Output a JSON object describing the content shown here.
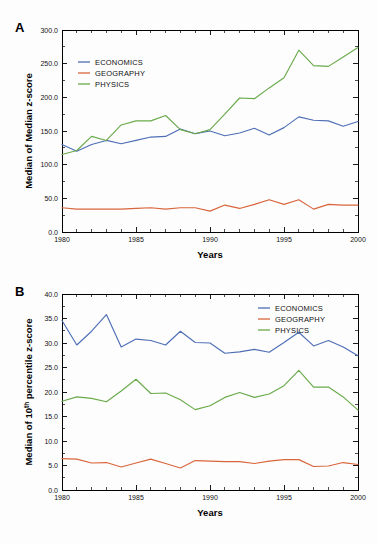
{
  "figure": {
    "background": "#fdfdfd",
    "panels": [
      "A",
      "B"
    ]
  },
  "colors": {
    "economics": "#4f6fb5",
    "geography": "#d9653b",
    "physics": "#6aaa4a",
    "axis": "#000000"
  },
  "panel_a": {
    "label": "A",
    "chart_data": {
      "type": "line",
      "title": "",
      "xlabel": "Years",
      "ylabel": "Median of Median z-score",
      "xlim": [
        1980,
        2000
      ],
      "ylim": [
        0,
        300
      ],
      "xticks": [
        1980,
        1985,
        1990,
        1995,
        2000
      ],
      "xtick_labels": [
        "1980",
        "1985",
        "1990",
        "1995",
        "2000"
      ],
      "yticks": [
        0,
        50,
        100,
        150,
        200,
        250,
        300
      ],
      "ytick_labels": [
        "0.0",
        "50.0",
        "100.0",
        "150.0",
        "200.0",
        "250.0",
        "300.0"
      ],
      "x": [
        1980,
        1981,
        1982,
        1983,
        1984,
        1985,
        1986,
        1987,
        1988,
        1989,
        1990,
        1991,
        1992,
        1993,
        1994,
        1995,
        1996,
        1997,
        1998,
        1999,
        2000
      ],
      "grid": false,
      "legend_position": "upper-left",
      "series": [
        {
          "name": "ECONOMICS",
          "color": "#4f6fb5",
          "values": [
            130,
            120,
            130,
            136,
            131,
            136,
            141,
            142,
            153,
            146,
            150,
            143,
            147,
            154,
            144,
            155,
            171,
            166,
            165,
            157,
            164
          ]
        },
        {
          "name": "GEOGRAPHY",
          "color": "#d9653b",
          "values": [
            36,
            34,
            34,
            34,
            34,
            35,
            36,
            34,
            36,
            36,
            31,
            40,
            35,
            41,
            48,
            41,
            48,
            34,
            41,
            40,
            40
          ]
        },
        {
          "name": "PHYSICS",
          "color": "#6aaa4a",
          "values": [
            115,
            121,
            142,
            136,
            159,
            165,
            165,
            173,
            152,
            146,
            152,
            175,
            199,
            198,
            214,
            229,
            270,
            247,
            246,
            260,
            274
          ]
        }
      ]
    }
  },
  "panel_b": {
    "label": "B",
    "chart_data": {
      "type": "line",
      "title": "",
      "xlabel": "Years",
      "ylabel": "Median of 10th percentile z-score",
      "ylabel_parts": {
        "before": "Median of 10",
        "sup": "th",
        "after": " percentile z-score"
      },
      "xlim": [
        1980,
        2000
      ],
      "ylim": [
        0,
        40
      ],
      "xticks": [
        1980,
        1985,
        1990,
        1995,
        2000
      ],
      "xtick_labels": [
        "1980",
        "1985",
        "1990",
        "1995",
        "2000"
      ],
      "yticks": [
        0,
        5,
        10,
        15,
        20,
        25,
        30,
        35,
        40
      ],
      "ytick_labels": [
        "0.0",
        "5.0",
        "10.0",
        "15.0",
        "20.0",
        "25.0",
        "30.0",
        "35.0",
        "40.0"
      ],
      "x": [
        1980,
        1981,
        1982,
        1983,
        1984,
        1985,
        1986,
        1987,
        1988,
        1989,
        1990,
        1991,
        1992,
        1993,
        1994,
        1995,
        1996,
        1997,
        1998,
        1999,
        2000
      ],
      "grid": false,
      "legend_position": "upper-right",
      "series": [
        {
          "name": "ECONOMICS",
          "color": "#4f6fb5",
          "values": [
            34.6,
            29.6,
            32.4,
            35.8,
            29.2,
            30.8,
            30.5,
            29.6,
            32.4,
            30.1,
            30.0,
            27.9,
            28.2,
            28.7,
            28.1,
            30.1,
            32.2,
            29.4,
            30.5,
            29.2,
            27.4
          ]
        },
        {
          "name": "GEOGRAPHY",
          "color": "#d9653b",
          "values": [
            6.4,
            6.3,
            5.5,
            5.6,
            4.7,
            5.5,
            6.3,
            5.4,
            4.5,
            6.0,
            5.9,
            5.8,
            5.8,
            5.4,
            5.9,
            6.2,
            6.2,
            4.8,
            4.9,
            5.6,
            5.2
          ]
        },
        {
          "name": "PHYSICS",
          "color": "#6aaa4a",
          "values": [
            18.1,
            19.0,
            18.7,
            18.0,
            20.2,
            22.6,
            19.7,
            19.8,
            18.4,
            16.4,
            17.2,
            18.9,
            19.9,
            18.9,
            19.6,
            21.3,
            24.4,
            21.0,
            21.0,
            19.0,
            16.3
          ]
        }
      ]
    }
  }
}
